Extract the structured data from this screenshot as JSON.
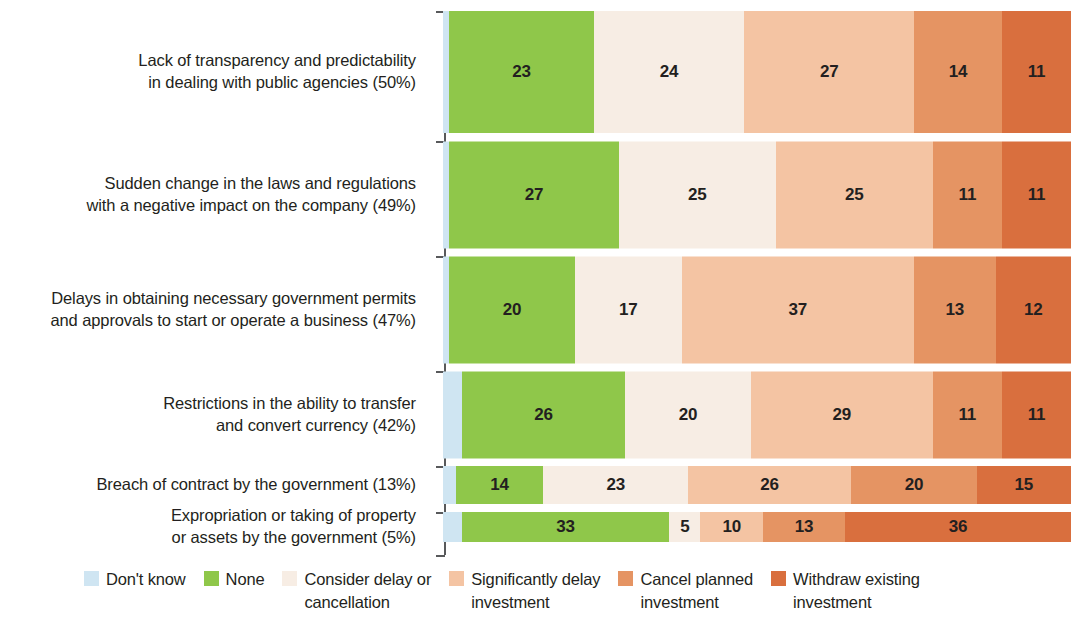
{
  "chart_data": {
    "type": "bar",
    "subtype": "stacked-horizontal-100",
    "title": "",
    "subtitle": "",
    "xlabel": "",
    "ylabel": "",
    "xlim": [
      0,
      100
    ],
    "grid": false,
    "legend_position": "bottom",
    "categories": [
      "Lack of transparency and predictability\nin dealing with public agencies (50%)",
      "Sudden change in the laws and regulations\nwith a negative impact on the company (49%)",
      "Delays in obtaining necessary government permits\nand approvals to start or operate a business (47%)",
      "Restrictions in the ability to transfer\nand convert currency (42%)",
      "Breach of contract by the government (13%)",
      "Expropriation or taking of property\nor assets by the government (5%)"
    ],
    "series": [
      {
        "name": "Don't know",
        "color": "#cfe5f2",
        "values": [
          1,
          1,
          1,
          3,
          2,
          3
        ]
      },
      {
        "name": "None",
        "color": "#8fc74a",
        "values": [
          23,
          27,
          20,
          26,
          14,
          33
        ]
      },
      {
        "name": "Consider delay or cancellation",
        "color": "#f7ede4",
        "values": [
          24,
          25,
          17,
          20,
          23,
          5
        ]
      },
      {
        "name": "Significantly delay investment",
        "color": "#f4c4a3",
        "values": [
          27,
          25,
          37,
          29,
          26,
          10
        ]
      },
      {
        "name": "Cancel planned investment",
        "color": "#e59463",
        "values": [
          14,
          11,
          13,
          11,
          20,
          13
        ]
      },
      {
        "name": "Withdraw existing investment",
        "color": "#d96f3e",
        "values": [
          11,
          11,
          12,
          11,
          15,
          36
        ]
      }
    ]
  },
  "legend": {
    "items": [
      {
        "label": "Don't know",
        "color": "#cfe5f2"
      },
      {
        "label": "None",
        "color": "#8fc74a"
      },
      {
        "label": "Consider delay or\ncancellation",
        "color": "#f7ede4"
      },
      {
        "label": "Significantly delay\ninvestment",
        "color": "#f4c4a3"
      },
      {
        "label": "Cancel planned\ninvestment",
        "color": "#e59463"
      },
      {
        "label": "Withdraw existing\ninvestment",
        "color": "#d96f3e"
      }
    ]
  },
  "layout": {
    "row_tops": [
      11,
      141,
      256,
      371,
      466,
      512
    ],
    "row_heights": [
      122,
      107,
      107,
      87,
      38,
      30
    ],
    "axis_ticks": [
      0,
      130,
      245,
      360,
      455,
      501,
      544
    ]
  }
}
